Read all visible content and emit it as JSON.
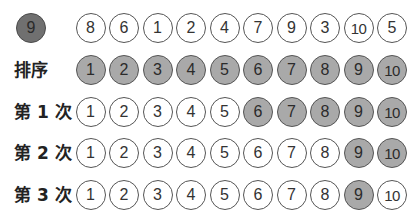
{
  "target": {
    "value": "9",
    "fill": "#707070"
  },
  "colors": {
    "highlight": "#a9a9a9",
    "target": "#707070",
    "border": "#555555",
    "plain": "#ffffff"
  },
  "rows": [
    {
      "label": "",
      "values": [
        "8",
        "6",
        "1",
        "2",
        "4",
        "7",
        "9",
        "3",
        "10",
        "5"
      ],
      "highlighted": [
        false,
        false,
        false,
        false,
        false,
        false,
        false,
        false,
        false,
        false
      ]
    },
    {
      "label": "排序",
      "values": [
        "1",
        "2",
        "3",
        "4",
        "5",
        "6",
        "7",
        "8",
        "9",
        "10"
      ],
      "highlighted": [
        true,
        true,
        true,
        true,
        true,
        true,
        true,
        true,
        true,
        true
      ]
    },
    {
      "label": "第 1 次",
      "values": [
        "1",
        "2",
        "3",
        "4",
        "5",
        "6",
        "7",
        "8",
        "9",
        "10"
      ],
      "highlighted": [
        false,
        false,
        false,
        false,
        false,
        true,
        true,
        true,
        true,
        true
      ]
    },
    {
      "label": "第 2 次",
      "values": [
        "1",
        "2",
        "3",
        "4",
        "5",
        "6",
        "7",
        "8",
        "9",
        "10"
      ],
      "highlighted": [
        false,
        false,
        false,
        false,
        false,
        false,
        false,
        false,
        true,
        true
      ]
    },
    {
      "label": "第 3 次",
      "values": [
        "1",
        "2",
        "3",
        "4",
        "5",
        "6",
        "7",
        "8",
        "9",
        "10"
      ],
      "highlighted": [
        false,
        false,
        false,
        false,
        false,
        false,
        false,
        false,
        true,
        false
      ]
    }
  ]
}
